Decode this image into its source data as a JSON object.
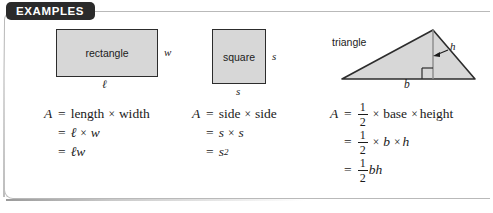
{
  "panel": {
    "tab_label": "EXAMPLES"
  },
  "figures": [
    {
      "name": "rectangle",
      "shape_label": "rectangle",
      "side_label": "w",
      "base_label": "ℓ",
      "fill_color": "#d7d7d7",
      "stroke_color": "#2c2c2c"
    },
    {
      "name": "square",
      "shape_label": "square",
      "side_label": "s",
      "base_label": "s",
      "fill_color": "#d7d7d7",
      "stroke_color": "#2c2c2c"
    },
    {
      "name": "triangle",
      "shape_label": "triangle",
      "height_label": "h",
      "base_label": "b",
      "fill_color": "#d7d7d7",
      "stroke_color": "#2c2c2c"
    }
  ],
  "formulas": {
    "rectangle": {
      "var": "A",
      "eq": "=",
      "line1_words": "length",
      "line1_words2": "width",
      "times": "×",
      "line2_a": "ℓ",
      "line2_b": "w",
      "line3": "ℓw"
    },
    "square": {
      "var": "A",
      "eq": "=",
      "line1_words": "side",
      "line1_words2": "side",
      "times": "×",
      "line2_a": "s",
      "line2_b": "s",
      "line3_base": "s",
      "line3_exp": "2"
    },
    "triangle": {
      "var": "A",
      "eq": "=",
      "frac_num": "1",
      "frac_den": "2",
      "times": "×",
      "line1_words": "base",
      "line1_words2": "height",
      "line2_a": "b",
      "line2_b": "h",
      "line3": "bh"
    }
  }
}
